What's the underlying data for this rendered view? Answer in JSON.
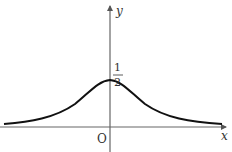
{
  "figure": {
    "type": "function-graph",
    "function": "bell-shaped curve with maximum 1/2 at x=0",
    "axes": {
      "x_label": "x",
      "y_label": "y",
      "origin_label": "O"
    },
    "annotations": {
      "peak_numerator": "1",
      "peak_denominator": "2"
    },
    "colors": {
      "curve": "#111111",
      "axis": "#555555",
      "text": "#333333"
    }
  }
}
